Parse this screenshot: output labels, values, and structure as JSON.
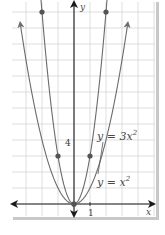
{
  "chart_data": {
    "type": "line",
    "title": "",
    "xlabel": "x",
    "ylabel": "y",
    "xlim": [
      -4.5,
      4.5
    ],
    "ylim": [
      -1,
      13
    ],
    "grid": true,
    "tick_labels": {
      "x": [
        "1"
      ],
      "y": [
        "4"
      ]
    },
    "series": [
      {
        "name": "y = x^2",
        "label": "y = x",
        "exponent": "2",
        "function": "x^2",
        "points": [
          [
            -3,
            9
          ],
          [
            -2,
            4
          ],
          [
            -1,
            1
          ],
          [
            0,
            0
          ],
          [
            1,
            1
          ],
          [
            2,
            4
          ],
          [
            3,
            9
          ]
        ],
        "marked_points": [
          [
            0,
            0
          ]
        ]
      },
      {
        "name": "y = 3x^2",
        "label": "y = 3x",
        "exponent": "2",
        "function": "3x^2",
        "points": [
          [
            -2,
            12
          ],
          [
            -1,
            3
          ],
          [
            0,
            0
          ],
          [
            1,
            3
          ],
          [
            2,
            12
          ]
        ],
        "marked_points": [
          [
            -2,
            12
          ],
          [
            -1,
            3
          ],
          [
            0,
            0
          ],
          [
            1,
            3
          ],
          [
            2,
            12
          ]
        ]
      }
    ],
    "legend_position": "inline-right"
  },
  "labels": {
    "x_axis": "x",
    "y_axis": "y",
    "x_tick": "1",
    "y_tick": "4",
    "eq1_main": "y = 3x",
    "eq1_sup": "2",
    "eq2_main": "y = x",
    "eq2_sup": "2"
  },
  "colors": {
    "curve": "#6b6b6b",
    "axis": "#1a1a1a",
    "grid": "#d0d0d0",
    "point": "#555555"
  }
}
